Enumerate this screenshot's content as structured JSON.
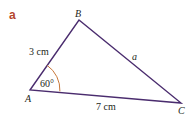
{
  "part_label": "a",
  "vertices": {
    "A": {
      "label": "A",
      "x": 30,
      "y": 90
    },
    "B": {
      "label": "B",
      "x": 79,
      "y": 20
    },
    "C": {
      "label": "C",
      "x": 181,
      "y": 103
    }
  },
  "sides": {
    "AB": "3 cm",
    "AC": "7 cm",
    "BC": "a"
  },
  "angle_A": "60°",
  "colors": {
    "stroke": "#4a2c6e",
    "arc": "#c8783a",
    "part_label": "#b5462d",
    "text": "#231f20"
  }
}
